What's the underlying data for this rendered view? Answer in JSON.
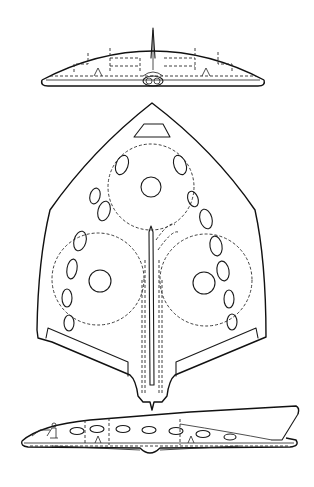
{
  "drawing": {
    "type": "three-view technical drawing",
    "subject": "flying-wing aircraft",
    "views": [
      {
        "id": "front",
        "label": "Front view"
      },
      {
        "id": "top",
        "label": "Plan view"
      },
      {
        "id": "side",
        "label": "Side view"
      }
    ],
    "colors": {
      "ink": "#1a1a1a",
      "paper": "#ffffff"
    }
  },
  "plan_view": {
    "large_dashed_circles": 3,
    "engine_circles": 3,
    "left_windows": 6,
    "right_windows": 6
  },
  "side_view": {
    "windows": 7
  }
}
